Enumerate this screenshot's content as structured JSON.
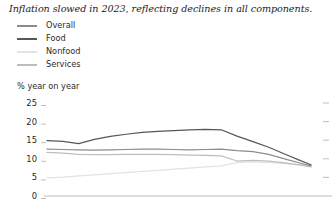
{
  "title": "Inflation slowed in 2023, reflecting declines in all components.",
  "axis_unit_label": "% year on year",
  "colors": {
    "overall": "#8c8c8c",
    "food": "#575757",
    "nonfood": "#e3e3e3",
    "services": "#bdbdbd",
    "axis": "#b5b5b5",
    "tick_text": "#2b2b2b",
    "title_text": "#1a1a1a"
  },
  "legend": {
    "items": [
      {
        "label": "Overall",
        "color": "#8c8c8c",
        "series": "overall"
      },
      {
        "label": "Food",
        "color": "#575757",
        "series": "food"
      },
      {
        "label": "Nonfood",
        "color": "#e3e3e3",
        "series": "nonfood"
      },
      {
        "label": "Services",
        "color": "#bdbdbd",
        "series": "services"
      }
    ]
  },
  "yaxis": {
    "ticks": [
      25,
      20,
      15,
      10,
      5,
      0
    ],
    "tick_labels": [
      "25",
      "20",
      "15",
      "10",
      "5",
      "0"
    ],
    "min": 0,
    "max": 25
  },
  "chart_data": {
    "type": "line",
    "title": "Inflation slowed in 2023, reflecting declines in all components.",
    "xlabel": "",
    "ylabel": "% year on year",
    "ylim": [
      0,
      25
    ],
    "xlim": [
      0,
      100
    ],
    "grid": false,
    "legend_position": "top-left",
    "x": [
      0,
      6,
      12,
      18,
      24,
      30,
      36,
      42,
      48,
      54,
      60,
      66,
      72,
      78,
      84,
      90,
      96,
      100
    ],
    "series": [
      {
        "name": "Overall",
        "color": "#8c8c8c",
        "values": [
          12.6,
          12.5,
          12.4,
          12.3,
          12.4,
          12.5,
          12.6,
          12.6,
          12.5,
          12.4,
          12.5,
          12.6,
          12.2,
          11.9,
          11.2,
          10.0,
          8.8,
          8.1
        ]
      },
      {
        "name": "Food",
        "color": "#575757",
        "values": [
          14.9,
          14.7,
          14.1,
          15.2,
          16.0,
          16.6,
          17.1,
          17.4,
          17.6,
          17.8,
          17.9,
          17.8,
          16.1,
          14.6,
          13.1,
          11.3,
          9.5,
          8.4
        ]
      },
      {
        "name": "Nonfood",
        "color": "#e3e3e3",
        "values": [
          4.9,
          5.1,
          5.4,
          5.7,
          6.0,
          6.3,
          6.6,
          6.9,
          7.2,
          7.5,
          7.8,
          8.1,
          9.0,
          9.2,
          9.0,
          8.7,
          8.4,
          8.2
        ]
      },
      {
        "name": "Services",
        "color": "#bdbdbd",
        "values": [
          11.7,
          11.5,
          11.2,
          11.1,
          11.1,
          11.2,
          11.2,
          11.2,
          11.1,
          11.0,
          10.9,
          10.8,
          9.4,
          9.6,
          9.4,
          8.9,
          8.3,
          7.8
        ]
      }
    ]
  }
}
